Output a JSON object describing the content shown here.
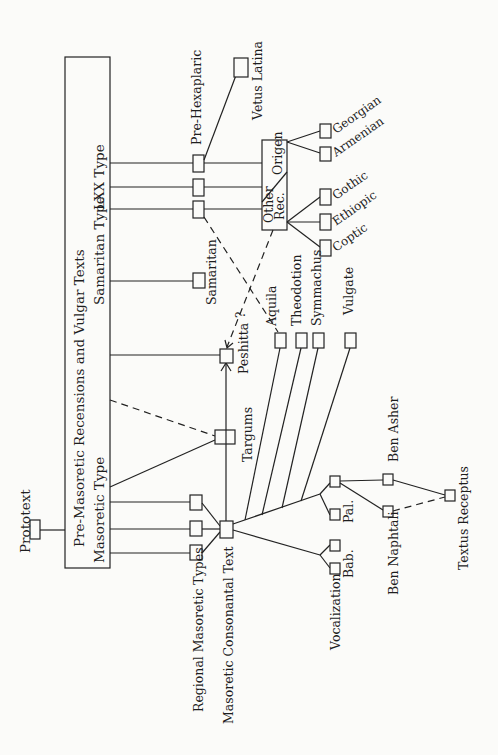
{
  "diagram": {
    "orientation": "rotated 90 degrees counter-clockwise",
    "colors": {
      "ink": "#222222",
      "paper": "#fbfbf9"
    },
    "nodes": {
      "prototext": "Prototext",
      "main_box": "Pre-Masoretic Recensions and Vulgar Texts",
      "masoretic_type": "Masoretic Type",
      "samaritan_type": "Samaritan Type",
      "lxx_type": "LXX Type",
      "regional": "Regional Masoretic Types",
      "consonantal": "Masoretic Consonantal Text",
      "targums": "Targums",
      "peshitta": "Peshitta",
      "samaritan": "Samaritan",
      "pre_hexaplaric": "Pre-Hexaplaric",
      "vetus_latina": "Vetus Latina",
      "origen": "Origen",
      "other_rec_1": "Other",
      "other_rec_2": "Rec.",
      "georgian": "Georgian",
      "armenian": "Armenian",
      "gothic": "Gothic",
      "ethiopic": "Ethiopic",
      "coptic": "Coptic",
      "aquila": "Aquila",
      "theodotion": "Theodotion",
      "symmachus": "Symmachus",
      "vulgate": "Vulgate",
      "vocalization": "Vocalization",
      "bab": "Bab.",
      "pal": "Pal.",
      "ben_asher": "Ben Asher",
      "ben_naphtali": "Ben Naphtali",
      "textus_receptus": "Textus Receptus",
      "question_mark": "?"
    }
  }
}
